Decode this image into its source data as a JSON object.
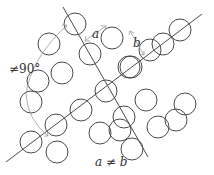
{
  "diagram": {
    "colors": {
      "stroke": "#4a4a4a",
      "arrow": "#9a9a9a",
      "background": "#ffffff"
    },
    "circle_radius": 11,
    "circles": [
      [
        49,
        44
      ],
      [
        75,
        24
      ],
      [
        90,
        54
      ],
      [
        112,
        38
      ],
      [
        150,
        50
      ],
      [
        180,
        30
      ],
      [
        38,
        81
      ],
      [
        62,
        73
      ],
      [
        131,
        67
      ],
      [
        163,
        44
      ],
      [
        31,
        102
      ],
      [
        56,
        125
      ],
      [
        81,
        110
      ],
      [
        106,
        91
      ],
      [
        129,
        67
      ],
      [
        57,
        152
      ],
      [
        100,
        133
      ],
      [
        124,
        117
      ],
      [
        146,
        100
      ],
      [
        185,
        104
      ],
      [
        31,
        142
      ],
      [
        120,
        130
      ],
      [
        132,
        149
      ],
      [
        158,
        127
      ],
      [
        176,
        120
      ]
    ],
    "lines": [
      {
        "name": "lattice-line-a",
        "x1": 6,
        "y1": 162,
        "x2": 202,
        "y2": 14
      },
      {
        "name": "lattice-line-b",
        "x1": 63,
        "y1": 7,
        "x2": 148,
        "y2": 157
      }
    ],
    "labels": {
      "a": "a",
      "b": "b",
      "angle": "≠90°",
      "condition": "a ≠ b"
    }
  }
}
